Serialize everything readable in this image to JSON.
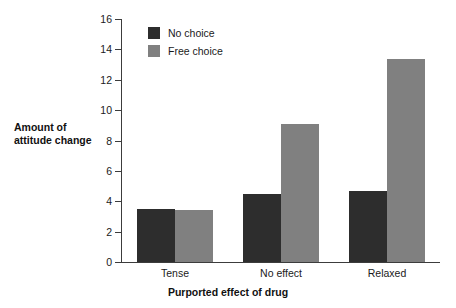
{
  "chart_data": {
    "type": "bar",
    "title": "",
    "subtitle": "",
    "xlabel": "Purported effect of drug",
    "ylabel": "Amount of attitude change",
    "ylabel_line1": "Amount of",
    "ylabel_line2": "attitude change",
    "categories": [
      "Tense",
      "No effect",
      "Relaxed"
    ],
    "series": [
      {
        "name": "No choice",
        "color": "#2d2d2d",
        "values": [
          3.5,
          4.5,
          4.7
        ]
      },
      {
        "name": "Free choice",
        "color": "#808080",
        "values": [
          3.4,
          9.1,
          13.4
        ]
      }
    ],
    "ylim": [
      0,
      16
    ],
    "yticks": [
      0,
      2,
      4,
      6,
      8,
      10,
      12,
      14,
      16
    ],
    "ytick_labels": [
      "0",
      "2",
      "4",
      "6",
      "8",
      "10",
      "12",
      "14",
      "16"
    ],
    "grid": false,
    "legend_position": "top-left-inside",
    "background": "#ffffff",
    "axis_color": "#3c3c3c"
  },
  "legend": {
    "items": [
      {
        "label": "No choice",
        "swatch": "dark"
      },
      {
        "label": "Free choice",
        "swatch": "light"
      }
    ]
  }
}
